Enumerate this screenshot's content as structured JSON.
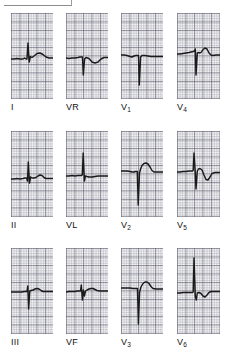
{
  "figure": {
    "kind": "12-lead-ecg",
    "paper": {
      "fine_grid_mm": 1,
      "bold_grid_mm": 5,
      "grid_color": "#5c5c6c",
      "fine_grid_color": "#8c8c9b",
      "background": "#fdfdfd",
      "trace_color": "#1a1a1a"
    },
    "top_rule": {
      "visible": true
    },
    "columns": 4,
    "rows": 3
  },
  "leads": [
    {
      "id": "I",
      "label": "I",
      "subscript": "",
      "row": 0,
      "column": 0,
      "morphology": "small r, small s, upright rounded T",
      "path": "M0,46 L3,46 L6,45.5 L9,46 L12,46 L13.5,45 L15,46 L16,46 L17,30 L18.2,49 L19.4,43.5 L21,44.5 L23,43 L26,40.5 L29,40 L32,41.5 L35,44 L38,45 L42,45 L42,45"
    },
    {
      "id": "VR",
      "label": "VR",
      "subscript": "",
      "row": 0,
      "column": 1,
      "morphology": "QS complex, inverted T",
      "path": "M0,45 L3,45.5 L6,45 L9,45 L12,44.5 L14,44 L15.5,44 L16.5,44 L17.3,62 L18.6,46 L20,44.5 L23,45.5 L26,49 L29,50 L32,49 L35,46 L38,44.5 L42,44.5"
    },
    {
      "id": "V1",
      "label": "V",
      "subscript": "1",
      "row": 0,
      "column": 2,
      "morphology": "deep narrow QS complex, flat T",
      "path": "M0,42 L3,42 L6,42.5 L9,43.5 L11,44 L13,43 L15,42.5 L16.5,42.5 L17.5,42.5 L18.3,72 L19.6,44 L21,42.5 L24,42.5 L27,43 L30,43.5 L33,43.5 L36,43.5 L39,43.5 L42,43.5"
    },
    {
      "id": "V4",
      "label": "V",
      "subscript": "4",
      "row": 0,
      "column": 3,
      "morphology": "small r, deep S, upright T",
      "path": "M0,41 L3,41 L6,40.5 L9,40 L12,39.5 L14,39 L16,38.5 L17.5,38 L18.3,36 L19,62 L20.3,40 L21.5,39.5 L23,40 L24.5,39 L26,36.5 L28,35 L30,36 L32,40 L34,42 L36,42.5 L39,42 L43,42"
    },
    {
      "id": "II",
      "label": "II",
      "subscript": "",
      "row": 1,
      "column": 0,
      "morphology": "small q, R wave, small s, low T",
      "path": "M0,48 L3,48 L6,47.5 L9,48 L12,47.5 L14,47 L15.5,47 L16.5,50 L17.3,31 L18.5,52 L19.6,46 L21,47 L23,47 L25,46.5 L27,45 L29,44 L31,44.5 L33,46.5 L35,47.5 L38,47.5 L42,47.5"
    },
    {
      "id": "VL",
      "label": "VL",
      "subscript": "",
      "row": 1,
      "column": 1,
      "morphology": "tall narrow R wave, small s, flat T",
      "path": "M0,45 L3,45 L6,44.5 L9,45 L12,44.5 L14,44.5 L15.5,44.5 L16.3,44 L17.2,22 L18.4,50 L19.4,45 L21,45.5 L23,46 L26,46 L29,45.5 L32,45 L35,45 L38,45 L42,45"
    },
    {
      "id": "V2",
      "label": "V",
      "subscript": "2",
      "row": 1,
      "column": 2,
      "morphology": "deep QS complex, broad upright T",
      "path": "M0,40 L3,40 L6,40 L9,40.5 L11,41 L13,41 L14.5,40.5 L15.5,40.5 L16.3,40.5 L17.2,74 L18.5,42 L19.6,38 L21,34.5 L23,32.5 L25,32 L27,33 L29,36 L31,39.5 L33,41 L36,41 L39,41 L42,41"
    },
    {
      "id": "V5",
      "label": "V",
      "subscript": "5",
      "row": 1,
      "column": 3,
      "morphology": "tall R, deep S, inverted T",
      "path": "M0,41 L3,41 L6,40.5 L9,40.5 L12,40 L14,40 L15.5,40 L16.2,39.5 L17,22 L18.2,40 L19,58 L20.3,40 L21.5,38 L23,37.5 L25,39 L27,44 L29,48.5 L31,49 L33,46 L35,42.5 L38,41.5 L43,41.5"
    },
    {
      "id": "III",
      "label": "III",
      "subscript": "",
      "row": 2,
      "column": 0,
      "morphology": "rS complex, flat low T",
      "path": "M0,44 L4,44 L8,44 L11,44 L13,43.5 L15,43.5 L16,43.5 L16.8,38 L17.6,61 L18.8,43 L20,42.5 L22,42 L24,41 L26,40.5 L28,41 L30,42.5 L32,43.5 L35,43.5 L38,43.5 L42,43.5"
    },
    {
      "id": "VF",
      "label": "VF",
      "subscript": "",
      "row": 2,
      "column": 1,
      "morphology": "small r, s wave, low flat T",
      "path": "M0,44 L3,43.5 L6,43.5 L9,43.5 L11,43 L13,43 L14.5,43 L15.3,37 L16.4,52 L17.4,42 L18.4,48 L19.5,43 L21,42 L23,41 L25,40.5 L27,40.5 L29,41.5 L31,42.5 L34,43 L38,43 L42,43"
    },
    {
      "id": "V3",
      "label": "V",
      "subscript": "3",
      "row": 2,
      "column": 2,
      "morphology": "deep QS complex, upright T",
      "path": "M0,40 L3,40 L6,40 L9,40 L12,40.5 L14,40.5 L15.5,40.5 L16.5,40.5 L17.4,76 L18.6,44 L20,39 L22,35.5 L24,34 L26,34 L28,35.5 L30,38.5 L32,40.5 L35,41 L38,41 L42,41"
    },
    {
      "id": "V6",
      "label": "V",
      "subscript": "6",
      "row": 2,
      "column": 3,
      "morphology": "very tall R wave, small s, biphasic T",
      "path": "M0,45 L3,45 L6,44.5 L9,44.5 L12,44.5 L14,44.5 L15.5,44.5 L16.2,44 L17,10 L18.3,48 L19.3,52 L20.3,45 L22,44.5 L24,45.5 L26,48 L28,49 L30,47 L32,44.5 L34,43.5 L37,43.5 L43,43.5"
    }
  ]
}
